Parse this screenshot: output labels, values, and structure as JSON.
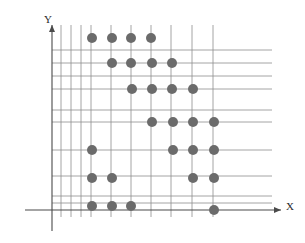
{
  "figure": {
    "kind": "scatter-grid-plot",
    "background_color": "#ffffff"
  },
  "axes": {
    "x_label": "X",
    "y_label": "Y",
    "axis_color": "#4a4a4a",
    "arrow_x_name": "x-axis-arrow",
    "arrow_y_name": "y-axis-arrow",
    "origin_px": {
      "x": 52,
      "y": 210
    }
  },
  "grid": {
    "color": "#8d8d8d",
    "line_width": 0.8,
    "vertical_x_px": [
      61,
      71,
      81,
      91,
      111,
      131,
      151,
      171,
      192,
      213
    ],
    "horizontal_y_px": [
      50,
      63,
      76,
      89,
      110,
      122,
      150,
      176,
      196,
      203
    ]
  },
  "chart_data": {
    "type": "scatter",
    "title": "",
    "xlabel": "X",
    "ylabel": "Y",
    "grid": true,
    "legend": null,
    "marker": {
      "shape": "circle",
      "color": "#6b6b6b",
      "radius_px": 5,
      "count": 28
    },
    "points_px": [
      {
        "x": 92,
        "y": 38
      },
      {
        "x": 112,
        "y": 38
      },
      {
        "x": 131,
        "y": 38
      },
      {
        "x": 151,
        "y": 38
      },
      {
        "x": 112,
        "y": 63
      },
      {
        "x": 131,
        "y": 63
      },
      {
        "x": 152,
        "y": 63
      },
      {
        "x": 172,
        "y": 63
      },
      {
        "x": 132,
        "y": 89
      },
      {
        "x": 152,
        "y": 89
      },
      {
        "x": 172,
        "y": 89
      },
      {
        "x": 193,
        "y": 89
      },
      {
        "x": 152,
        "y": 122
      },
      {
        "x": 173,
        "y": 122
      },
      {
        "x": 193,
        "y": 122
      },
      {
        "x": 214,
        "y": 122
      },
      {
        "x": 92,
        "y": 150
      },
      {
        "x": 173,
        "y": 150
      },
      {
        "x": 193,
        "y": 150
      },
      {
        "x": 214,
        "y": 150
      },
      {
        "x": 92,
        "y": 178
      },
      {
        "x": 112,
        "y": 178
      },
      {
        "x": 193,
        "y": 178
      },
      {
        "x": 214,
        "y": 178
      },
      {
        "x": 92,
        "y": 206
      },
      {
        "x": 112,
        "y": 206
      },
      {
        "x": 131,
        "y": 206
      },
      {
        "x": 214,
        "y": 210
      }
    ]
  }
}
